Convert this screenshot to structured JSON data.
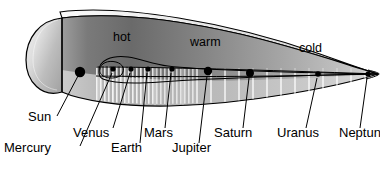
{
  "figure": {
    "type": "cut-away-cone-diagram"
  },
  "zones": [
    {
      "name": "hot",
      "label": "hot",
      "x": 113,
      "y": 41
    },
    {
      "name": "warm",
      "label": "warm",
      "x": 190,
      "y": 46
    },
    {
      "name": "cold",
      "label": "cold",
      "x": 299,
      "y": 52
    }
  ],
  "bodies": [
    {
      "name": "sun",
      "label": "Sun",
      "dot_x": 80,
      "dot_y": 72,
      "dot_r": 5.2,
      "label_x": 28,
      "label_y": 121,
      "leader": "M 78,76 L 57,116"
    },
    {
      "name": "mercury",
      "label": "Mercury",
      "dot_x": 113,
      "dot_y": 69,
      "dot_r": 2.6,
      "label_x": 4,
      "label_y": 152,
      "leader": "M 112,72 L 80,146"
    },
    {
      "name": "venus",
      "label": "Venus",
      "dot_x": 131,
      "dot_y": 69,
      "dot_r": 2.6,
      "label_x": 73,
      "label_y": 137,
      "leader": "M 130,72 L 113,128"
    },
    {
      "name": "earth",
      "label": "Earth",
      "dot_x": 148,
      "dot_y": 69,
      "dot_r": 2.6,
      "label_x": 111,
      "label_y": 152,
      "leader": "M 147,72 L 140,144"
    },
    {
      "name": "mars",
      "label": "Mars",
      "dot_x": 172,
      "dot_y": 69,
      "dot_r": 2.6,
      "label_x": 144,
      "label_y": 137,
      "leader": "M 171,72 L 165,128"
    },
    {
      "name": "jupiter",
      "label": "Jupiter",
      "dot_x": 208,
      "dot_y": 71,
      "dot_r": 4.2,
      "label_x": 172,
      "label_y": 152,
      "leader": "M 207,75 L 199,144"
    },
    {
      "name": "saturn",
      "label": "Saturn",
      "dot_x": 250,
      "dot_y": 73,
      "dot_r": 4.0,
      "label_x": 214,
      "label_y": 137,
      "leader": "M 249,77 L 243,128"
    },
    {
      "name": "uranus",
      "label": "Uranus",
      "dot_x": 318,
      "dot_y": 74,
      "dot_r": 2.8,
      "label_x": 277,
      "label_y": 137,
      "leader": "M 317,77 L 306,128"
    },
    {
      "name": "neptune",
      "label": "Neptun",
      "dot_x": 368,
      "dot_y": 74,
      "dot_r": 2.6,
      "label_x": 339,
      "label_y": 137,
      "leader": "M 367,77 L 360,128"
    }
  ],
  "colors": {
    "outline": "#000000",
    "text": "#000000",
    "background": "#ffffff",
    "top_surface_light": "#f2f2f2",
    "top_surface_dark": "#cfcfcf",
    "body_hot": "#6e6e6e",
    "body_warm": "#8e8e8e",
    "body_cold": "#b8b8b8",
    "lower_light": "#d8d8d8",
    "cap_light": "#e6e6e6",
    "cap_dark": "#9a9a9a",
    "hatch": "#ffffff"
  }
}
